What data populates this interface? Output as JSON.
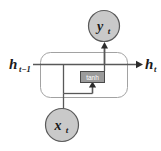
{
  "diagram": {
    "type": "rnn-cell-unit",
    "background_color": "#ffffff",
    "line_color": "#4d4d4d",
    "cell_border_color": "#9a9a9a",
    "node_fill_color": "#c9c9c9",
    "node_stroke_color": "#5a5a5a",
    "op_fill_color": "#9b9b9b",
    "op_stroke_color": "#4a4a4a",
    "op_text_color": "#ffffff",
    "text_color": "#1a1a1a",
    "nodes": {
      "output": {
        "id": "y-t",
        "label_main": "y",
        "label_sub": "t",
        "shape": "circle",
        "cx": 104,
        "cy": 26,
        "r": 16
      },
      "input": {
        "id": "x-t",
        "label_main": "x",
        "label_sub": "t",
        "shape": "circle",
        "cx": 62,
        "cy": 125,
        "r": 17
      }
    },
    "operation": {
      "id": "tanh-gate",
      "label": "tanh",
      "shape": "rect",
      "x": 80,
      "y": 71,
      "width": 25,
      "height": 12
    },
    "cell_boundary": {
      "id": "recurrent-cell-body",
      "x": 40,
      "y": 52,
      "width": 88,
      "height": 46,
      "corner_radius": 10
    },
    "edge_labels": {
      "hidden_in": {
        "label_main": "h",
        "label_sub": "t−1",
        "x": 9,
        "y": 68
      },
      "hidden_out": {
        "label_main": "h",
        "label_sub": "t",
        "x": 144,
        "y": 68
      }
    },
    "connections": [
      {
        "id": "hidden-in-to-cell",
        "from": "h-t-minus-1",
        "to": "cell-junction",
        "arrow": false
      },
      {
        "id": "recurrent-branch-down",
        "from": "hidden-line",
        "to": "tanh-input-bus",
        "arrow": false
      },
      {
        "id": "input-to-tanh",
        "from": "x-t",
        "to": "tanh-gate",
        "arrow": true,
        "arrow_direction": "up"
      },
      {
        "id": "tanh-to-hidden-out",
        "from": "tanh-gate",
        "to": "h-t",
        "arrow": true,
        "arrow_direction": "right"
      },
      {
        "id": "hidden-to-output",
        "from": "hidden-line",
        "to": "y-t",
        "arrow": true,
        "arrow_direction": "up"
      }
    ]
  }
}
